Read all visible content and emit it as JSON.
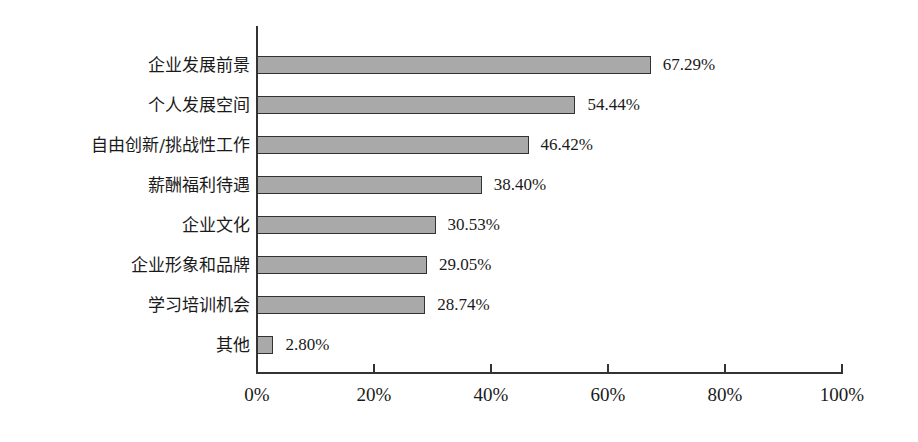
{
  "chart_data": {
    "type": "bar",
    "orientation": "horizontal",
    "title": "",
    "xlabel": "",
    "ylabel": "",
    "categories": [
      "企业发展前景",
      "个人发展空间",
      "自由创新/挑战性工作",
      "薪酬福利待遇",
      "企业文化",
      "企业形象和品牌",
      "学习培训机会",
      "其他"
    ],
    "values": [
      67.29,
      54.44,
      46.42,
      38.4,
      30.53,
      29.05,
      28.74,
      2.8
    ],
    "value_labels": [
      "67.29%",
      "54.44%",
      "46.42%",
      "38.40%",
      "30.53%",
      "29.05%",
      "28.74%",
      "2.80%"
    ],
    "xlim": [
      0,
      100
    ],
    "xticks": [
      0,
      20,
      40,
      60,
      80,
      100
    ],
    "xtick_labels": [
      "0%",
      "20%",
      "40%",
      "60%",
      "80%",
      "100%"
    ],
    "grid": false,
    "legend": null,
    "bar_color": "#a9a9a9",
    "bar_edge_color": "#333333"
  }
}
